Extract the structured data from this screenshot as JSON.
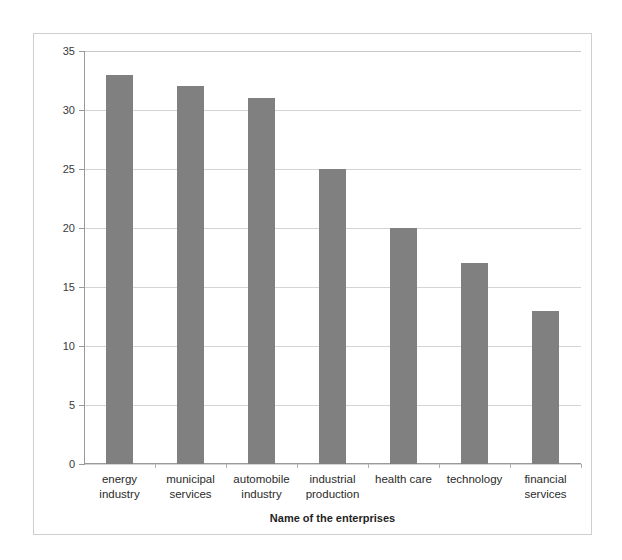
{
  "chart_data": {
    "type": "bar",
    "title": "",
    "xlabel": "Name of the enterprises",
    "ylabel": "% requirement",
    "categories": [
      "energy industry",
      "municipal services",
      "automobile industry",
      "industrial production",
      "health care",
      "technology",
      "financial services"
    ],
    "category_lines": [
      [
        "energy",
        "industry"
      ],
      [
        "municipal",
        "services"
      ],
      [
        "automobile",
        "industry"
      ],
      [
        "industrial",
        "production"
      ],
      [
        "health care",
        ""
      ],
      [
        "technology",
        ""
      ],
      [
        "financial",
        "services"
      ]
    ],
    "values": [
      33,
      32,
      31,
      25,
      20,
      17,
      13
    ],
    "ylim": [
      0,
      35
    ],
    "ytick_labels": [
      "35",
      "30",
      "25",
      "20",
      "15",
      "10",
      "5",
      "0"
    ],
    "ytick_values": [
      35,
      30,
      25,
      20,
      15,
      10,
      5,
      0
    ],
    "ytick_step": 5,
    "grid": true,
    "legend": null,
    "bar_color": "#808080",
    "gridline_color": "#d4d4d4",
    "axis_color": "#9a9a9a",
    "frame_color": "#cfcfcf",
    "background_color": "#ffffff"
  }
}
